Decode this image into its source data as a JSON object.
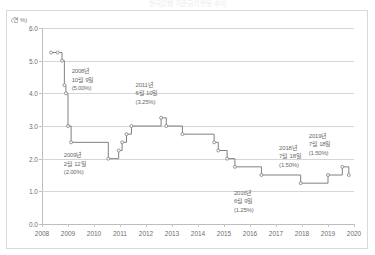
{
  "chart_title": "한국은행 기준금리 변동 추이",
  "y_unit_label": "(연 %)",
  "annotations": [
    {
      "id": "a2008",
      "year": "2008년",
      "date": "10월 9일",
      "rate": "(5.00%)",
      "x_pct": 9.5,
      "y_pct": 20.0
    },
    {
      "id": "a2009",
      "year": "2009년",
      "date": "2월 12일",
      "rate": "(2.00%)",
      "x_pct": 7.0,
      "y_pct": 63.0
    },
    {
      "id": "a2011",
      "year": "2011년",
      "date": "6월 10일",
      "rate": "(3.25%)",
      "x_pct": 30.0,
      "y_pct": 27.0
    },
    {
      "id": "a2016",
      "year": "2016년",
      "date": "6월 9일",
      "rate": "(1.25%)",
      "x_pct": 61.5,
      "y_pct": 82.0
    },
    {
      "id": "a2018",
      "year": "2018년",
      "date": "7월 18일",
      "rate": "(1.50%)",
      "x_pct": 76.0,
      "y_pct": 59.0
    },
    {
      "id": "a2019",
      "year": "2019년",
      "date": "7월 18일",
      "rate": "(1.50%)",
      "x_pct": 85.5,
      "y_pct": 53.0
    }
  ],
  "chart_data": {
    "type": "line",
    "title": "한국은행 기준금리 변동 추이",
    "xlabel": "",
    "ylabel": "(연 %)",
    "xlim": [
      2008,
      2020
    ],
    "ylim": [
      0.0,
      6.0
    ],
    "grid": true,
    "legend": "none",
    "line_style": "step-post",
    "marker": "circle-open",
    "series_color": "#808080",
    "x_ticks": [
      "2008",
      "2009",
      "2010",
      "2011",
      "2012",
      "2013",
      "2014",
      "2015",
      "2016",
      "2017",
      "2018",
      "2019",
      "2020"
    ],
    "y_ticks": [
      "0.0",
      "1.0",
      "2.0",
      "3.0",
      "4.0",
      "5.0",
      "6.0"
    ],
    "series": [
      {
        "name": "한국은행 기준금리",
        "x": [
          2008.35,
          2008.6,
          2008.77,
          2008.86,
          2008.92,
          2009.0,
          2009.12,
          2010.55,
          2010.95,
          2011.08,
          2011.25,
          2011.44,
          2012.58,
          2012.78,
          2013.4,
          2014.62,
          2014.78,
          2015.12,
          2015.42,
          2016.44,
          2017.95,
          2019.0,
          2019.55,
          2019.8
        ],
        "y": [
          5.25,
          5.25,
          5.0,
          4.25,
          4.0,
          3.0,
          2.5,
          2.0,
          2.25,
          2.5,
          2.75,
          3.0,
          3.25,
          3.0,
          2.75,
          2.5,
          2.25,
          2.0,
          1.75,
          1.5,
          1.25,
          1.5,
          1.75,
          1.5
        ]
      }
    ],
    "annotated_points": [
      {
        "label": "2008년 10월 9일",
        "value": 5.0
      },
      {
        "label": "2009년 2월 12일",
        "value": 2.0
      },
      {
        "label": "2011년 6월 10일",
        "value": 3.25
      },
      {
        "label": "2016년 6월 9일",
        "value": 1.25
      },
      {
        "label": "2018년 7월 18일",
        "value": 1.5
      },
      {
        "label": "2019년 7월 18일",
        "value": 1.5
      }
    ]
  }
}
